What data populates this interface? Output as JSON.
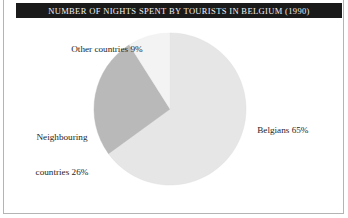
{
  "figure": {
    "title": "NUMBER OF NIGHTS SPENT BY TOURISTS IN BELGIUM (1990)",
    "frame_color": "#b4b4b4",
    "title_bar_color": "#1a1a1a",
    "title_text_color": "#f0f0f0",
    "background": "#ffffff"
  },
  "labels": {
    "other": "Other countries 9%",
    "neighbouring_line1": "Neighbouring",
    "neighbouring_line2": "countries 26%",
    "belgians": "Belgians 65%"
  },
  "chart_data": {
    "type": "pie",
    "title": "NUMBER OF NIGHTS SPENT BY TOURISTS IN BELGIUM (1990)",
    "xlabel": "",
    "ylabel": "",
    "unit": "percent",
    "total": 100,
    "start_angle_deg": 0,
    "direction": "clockwise",
    "legend": "none (direct slice labels)",
    "grid": false,
    "categories": [
      "Belgians",
      "Neighbouring countries",
      "Other countries"
    ],
    "values": [
      65,
      26,
      9
    ],
    "labels": [
      "Belgians 65%",
      "Neighbouring countries 26%",
      "Other countries 9%"
    ],
    "colors": [
      "#e6e6e6",
      "#b9b9b9",
      "#f3f3f3"
    ],
    "slices": [
      {
        "name": "Belgians",
        "value": 65,
        "label": "Belgians 65%",
        "color": "#e6e6e6",
        "start_deg": 0,
        "end_deg": 234
      },
      {
        "name": "Neighbouring countries",
        "value": 26,
        "label": "Neighbouring countries 26%",
        "color": "#b9b9b9",
        "start_deg": 234,
        "end_deg": 327.6
      },
      {
        "name": "Other countries",
        "value": 9,
        "label": "Other countries 9%",
        "color": "#f3f3f3",
        "start_deg": 327.6,
        "end_deg": 360
      }
    ]
  },
  "geometry": {
    "center_x": 170,
    "center_y": 91,
    "radius": 76
  }
}
